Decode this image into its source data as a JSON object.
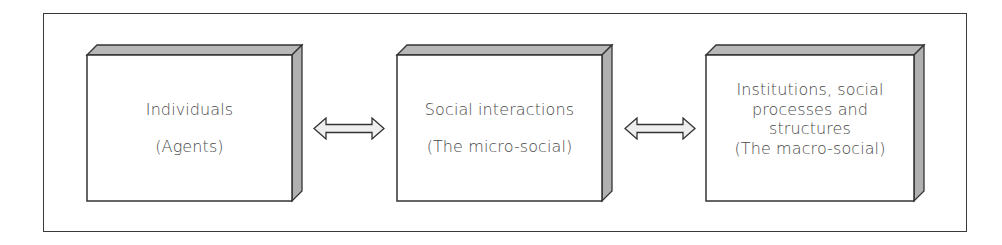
{
  "diagram": {
    "type": "flow",
    "direction": "horizontal",
    "colors": {
      "stroke": "#333333",
      "bevel_fill": "#b8b8b8",
      "face_fill": "#ffffff",
      "arrow_fill": "#eeeeee",
      "text": "#4a4a4a"
    },
    "boxes": [
      {
        "id": "individuals",
        "title": "Individuals",
        "subtitle": "(Agents)"
      },
      {
        "id": "social-interactions",
        "title": "Social interactions",
        "subtitle": "(The micro-social)"
      },
      {
        "id": "institutions",
        "title_lines": [
          "Institutions, social",
          "processes and",
          "structures"
        ],
        "subtitle": "(The macro-social)"
      }
    ],
    "connectors": [
      {
        "from": "individuals",
        "to": "social-interactions",
        "kind": "bidirectional-arrow"
      },
      {
        "from": "social-interactions",
        "to": "institutions",
        "kind": "bidirectional-arrow"
      }
    ]
  }
}
